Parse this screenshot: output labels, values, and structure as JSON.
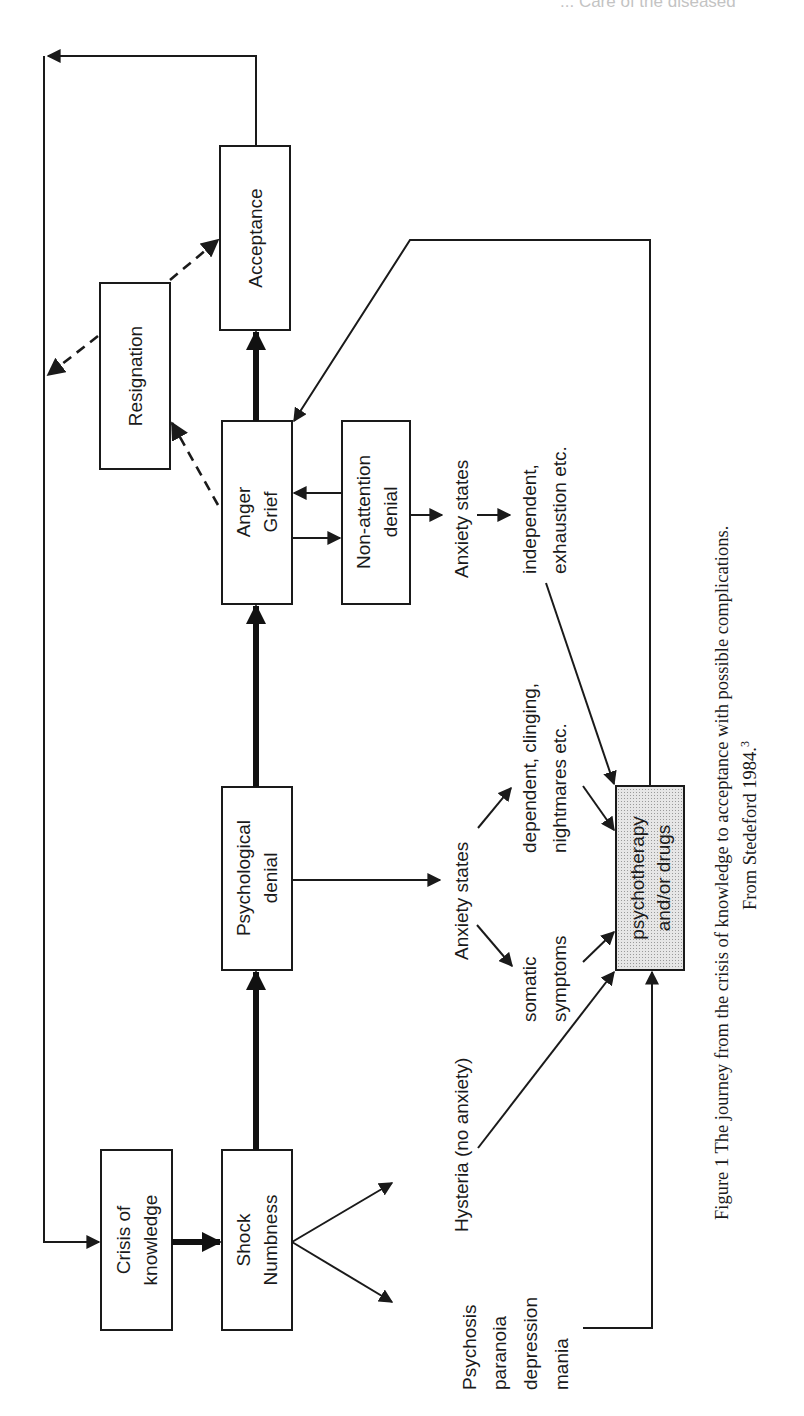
{
  "running_header": "... Care of the diseased",
  "diagram": {
    "nodes": {
      "crisis": {
        "line1": "Crisis of",
        "line2": "knowledge"
      },
      "shock": {
        "line1": "Shock",
        "line2": "Numbness"
      },
      "psych_denial": {
        "line1": "Psychological",
        "line2": "denial"
      },
      "anger": {
        "line1": "Anger",
        "line2": "Grief"
      },
      "non_attention": {
        "line1": "Non-attention",
        "line2": "denial"
      },
      "resignation": {
        "line1": "Resignation"
      },
      "acceptance": {
        "line1": "Acceptance"
      },
      "therapy": {
        "line1": "psychotherapy",
        "line2": "and/or drugs"
      }
    },
    "labels": {
      "psychosis": [
        "Psychosis",
        "paranoia",
        "depression",
        "mania"
      ],
      "hysteria": "Hysteria (no anxiety)",
      "anxiety1": "Anxiety states",
      "somatic": [
        "somatic",
        "symptoms"
      ],
      "dependent": [
        "dependent, clinging,",
        "nightmares etc."
      ],
      "anxiety2": "Anxiety states",
      "independent": [
        "independent,",
        "exhaustion etc."
      ]
    }
  },
  "caption": {
    "line1": "Figure 1  The journey from the crisis of knowledge to acceptance with possible complications.",
    "line2": "From Stedeford 1984.",
    "ref": "3"
  }
}
